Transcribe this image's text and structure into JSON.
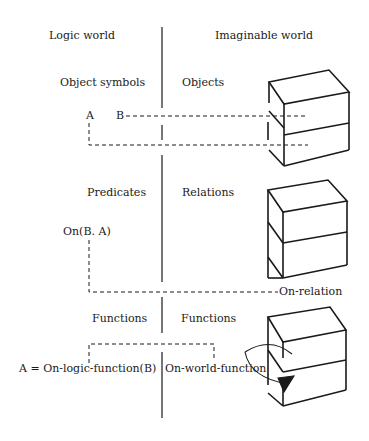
{
  "headers": {
    "left": "Logic world",
    "right": "Imaginable world"
  },
  "rows": [
    {
      "left_heading": "Object symbols",
      "right_heading": "Objects",
      "symbols": [
        "A",
        "B"
      ]
    },
    {
      "left_heading": "Predicates",
      "right_heading": "Relations",
      "expression": "On(B. A)",
      "relation_label": "On-relation"
    },
    {
      "left_heading": "Functions",
      "right_heading": "Functions",
      "logic_expression": "A = On-logic-function(B)",
      "world_function": "On-world-function"
    }
  ],
  "colors": {
    "ink": "#1a1a1a",
    "background": "#ffffff"
  }
}
